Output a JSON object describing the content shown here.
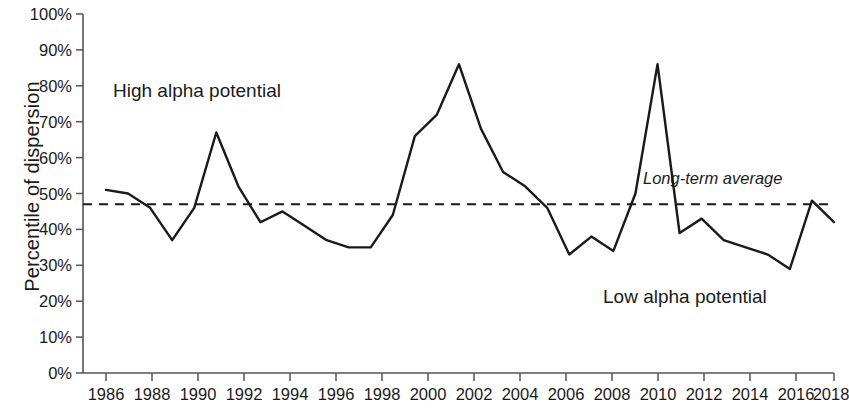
{
  "chart_data": {
    "type": "line",
    "title": "",
    "xlabel": "",
    "ylabel": "Percentile of dispersion",
    "xlim": [
      1985,
      2018
    ],
    "ylim": [
      0,
      100
    ],
    "grid": false,
    "legend_position": "none",
    "x_tick_labels": [
      "1986",
      "1988",
      "1990",
      "1992",
      "1994",
      "1996",
      "1998",
      "2000",
      "2002",
      "2004",
      "2006",
      "2008",
      "2010",
      "2012",
      "2014",
      "2016",
      "2018"
    ],
    "y_tick_labels": [
      "0%",
      "10%",
      "20%",
      "30%",
      "40%",
      "50%",
      "60%",
      "70%",
      "80%",
      "90%",
      "100%"
    ],
    "y_tick_values": [
      0,
      10,
      20,
      30,
      40,
      50,
      60,
      70,
      80,
      90,
      100
    ],
    "series": [
      {
        "name": "Percentile of dispersion",
        "color": "#1a1a1a",
        "style": "solid",
        "x": [
          1985,
          1986,
          1987,
          1988,
          1989,
          1990,
          1991,
          1992,
          1993,
          1994,
          1995,
          1996,
          1997,
          1998,
          1999,
          2000,
          2001,
          2002,
          2003,
          2004,
          2005,
          2006,
          2007,
          2008,
          2009,
          2010,
          2011,
          2012,
          2013,
          2014,
          2015,
          2016,
          2017,
          2018
        ],
        "values": [
          51,
          50,
          46,
          37,
          46,
          67,
          52,
          42,
          45,
          41,
          37,
          35,
          35,
          44,
          66,
          72,
          86,
          68,
          56,
          52,
          46,
          33,
          38,
          34,
          50,
          86,
          39,
          43,
          37,
          35,
          33,
          29,
          48,
          42
        ]
      }
    ],
    "reference_line": {
      "label": "Long-term average",
      "value": 47,
      "style": "dashed",
      "color": "#1a1a1a"
    },
    "annotations": [
      {
        "text": "High alpha potential",
        "x": 1989.5,
        "y": 88
      },
      {
        "text": "Low alpha potential",
        "x": 2012.5,
        "y": 20
      },
      {
        "text": "Long-term average",
        "x": 2014.8,
        "y": 53
      }
    ]
  },
  "axis": {
    "y_title": "Percentile of dispersion",
    "y_ticks": [
      "100%",
      "90%",
      "80%",
      "70%",
      "60%",
      "50%",
      "40%",
      "30%",
      "20%",
      "10%",
      "0%"
    ],
    "x_ticks": [
      "1986",
      "1988",
      "1990",
      "1992",
      "1994",
      "1996",
      "1998",
      "2000",
      "2002",
      "2004",
      "2006",
      "2008",
      "2010",
      "2012",
      "2014",
      "2016",
      "2018"
    ]
  },
  "annotations": {
    "high_alpha": "High alpha potential",
    "low_alpha": "Low alpha potential",
    "long_term_average": "Long-term average"
  },
  "colors": {
    "line": "#1a1a1a",
    "axis": "#555555",
    "background": "#ffffff",
    "text": "#1a1a1a"
  }
}
